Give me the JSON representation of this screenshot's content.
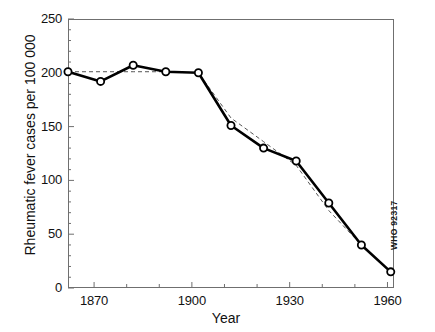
{
  "chart_data": {
    "type": "line",
    "title": "",
    "subtitle": "",
    "xlabel": "Year",
    "ylabel": "Rheumatic fever cases per 100 000",
    "xlim": [
      1862,
      1962
    ],
    "ylim": [
      0,
      250
    ],
    "xticks": [
      1870,
      1900,
      1930,
      1960
    ],
    "xtick_labels": [
      "1870",
      "1900",
      "1930",
      "1960"
    ],
    "xminor_ticks": [
      1880,
      1890,
      1910,
      1920,
      1940,
      1950
    ],
    "yticks": [
      0,
      50,
      100,
      150,
      200,
      250
    ],
    "ytick_labels": [
      "0",
      "50",
      "100",
      "150",
      "200",
      "250"
    ],
    "grid": false,
    "legend": null,
    "legend_position": "none",
    "x": [
      1862,
      1872,
      1882,
      1892,
      1902,
      1912,
      1922,
      1932,
      1942,
      1952,
      1961
    ],
    "series": [
      {
        "name": "Observed rheumatic fever cases",
        "style": "solid-with-open-circle-markers",
        "color": "#000000",
        "values": [
          201,
          192,
          207,
          201,
          200,
          151,
          130,
          118,
          79,
          40,
          15
        ]
      },
      {
        "name": "Fitted trend",
        "style": "dashed",
        "color": "#555555",
        "values": [
          201,
          201,
          201,
          201,
          200,
          158,
          136,
          114,
          72,
          40,
          15
        ]
      }
    ],
    "annotations": [
      {
        "name": "who-code",
        "text": "WHO 92317"
      }
    ]
  },
  "figure": {
    "who_code": "WHO 92317"
  }
}
